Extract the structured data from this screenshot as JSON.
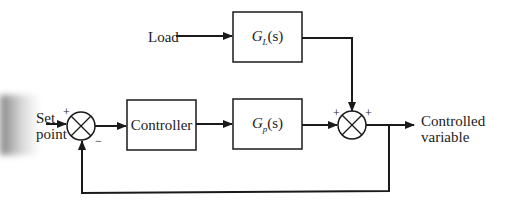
{
  "diagram": {
    "type": "feedback control block diagram",
    "inputs": {
      "setpoint_label_line1": "Set",
      "setpoint_label_line2": "point",
      "load_label": "Load"
    },
    "blocks": {
      "controller": "Controller",
      "process": {
        "symbol": "G",
        "subscript": "p",
        "arg": "(s)"
      },
      "load": {
        "symbol": "G",
        "subscript": "L",
        "arg": "(s)"
      }
    },
    "junctions": {
      "left": {
        "plus": "+",
        "minus": "−"
      },
      "right": {
        "plus_left": "+",
        "plus_top": "+"
      }
    },
    "output": {
      "label_line1": "Controlled",
      "label_line2": "variable"
    },
    "colors": {
      "line": "#1a1a1a",
      "background": "#ffffff"
    }
  }
}
